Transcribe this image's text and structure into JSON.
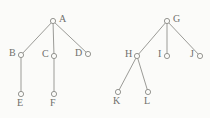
{
  "diagram": {
    "background_color": "#fbfbf9",
    "edge_color": "#9b9b97",
    "node_stroke_color": "#8a8a86",
    "node_fill_color": "#fbfbf9",
    "label_color": "#6f6f6c",
    "node_radius": 2.6,
    "trees": [
      {
        "name": "left-tree",
        "root": "A",
        "nodes": [
          {
            "id": "A",
            "label": "A",
            "x": 53,
            "y": 21,
            "label_x": 59,
            "label_y": 14
          },
          {
            "id": "B",
            "label": "B",
            "x": 21,
            "y": 55,
            "label_x": 9,
            "label_y": 48
          },
          {
            "id": "C",
            "label": "C",
            "x": 54,
            "y": 56,
            "label_x": 42,
            "label_y": 49
          },
          {
            "id": "D",
            "label": "D",
            "x": 88,
            "y": 54,
            "label_x": 75,
            "label_y": 48
          },
          {
            "id": "E",
            "label": "E",
            "x": 21,
            "y": 94,
            "label_x": 17,
            "label_y": 98
          },
          {
            "id": "F",
            "label": "F",
            "x": 54,
            "y": 94,
            "label_x": 50,
            "label_y": 98
          }
        ],
        "edges": [
          {
            "from": "A",
            "to": "B"
          },
          {
            "from": "A",
            "to": "C"
          },
          {
            "from": "A",
            "to": "D"
          },
          {
            "from": "B",
            "to": "E"
          },
          {
            "from": "C",
            "to": "F"
          }
        ]
      },
      {
        "name": "right-tree",
        "root": "G",
        "nodes": [
          {
            "id": "G",
            "label": "G",
            "x": 167,
            "y": 21,
            "label_x": 173,
            "label_y": 14
          },
          {
            "id": "H",
            "label": "H",
            "x": 137,
            "y": 56,
            "label_x": 125,
            "label_y": 49
          },
          {
            "id": "I",
            "label": "I",
            "x": 167,
            "y": 56,
            "label_x": 158,
            "label_y": 49
          },
          {
            "id": "J",
            "label": "J",
            "x": 200,
            "y": 56,
            "label_x": 190,
            "label_y": 49
          },
          {
            "id": "K",
            "label": "K",
            "x": 118,
            "y": 92,
            "label_x": 113,
            "label_y": 96
          },
          {
            "id": "L",
            "label": "L",
            "x": 148,
            "y": 92,
            "label_x": 144,
            "label_y": 96
          }
        ],
        "edges": [
          {
            "from": "G",
            "to": "H"
          },
          {
            "from": "G",
            "to": "I"
          },
          {
            "from": "G",
            "to": "J"
          },
          {
            "from": "H",
            "to": "K"
          },
          {
            "from": "H",
            "to": "L"
          }
        ]
      }
    ]
  }
}
